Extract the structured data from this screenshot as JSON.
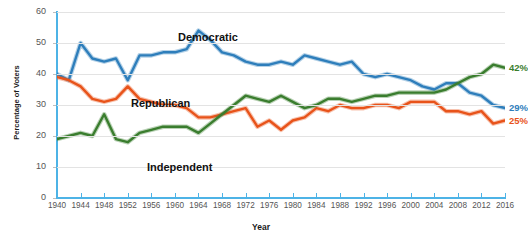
{
  "chart_data": {
    "type": "line",
    "title": "",
    "xlabel": "Year",
    "ylabel": "Percentage of Voters",
    "ylim": [
      0,
      60
    ],
    "xlim": [
      1940,
      2016
    ],
    "yticks": [
      0,
      10,
      20,
      30,
      40,
      50,
      60
    ],
    "xticks": [
      1940,
      1944,
      1948,
      1952,
      1956,
      1960,
      1964,
      1968,
      1972,
      1976,
      1980,
      1984,
      1988,
      1992,
      1996,
      2000,
      2004,
      2008,
      2012,
      2016
    ],
    "grid": true,
    "legend_position": "inline-on-plot",
    "colors": {
      "democratic": "#2e7ebb",
      "republican": "#e8531a",
      "independent": "#3a7d2e",
      "axis": "#4db3e6",
      "grid": "#e3e3e3",
      "tick_text": "#555555",
      "axis_title": "#1a1a1a"
    },
    "series": [
      {
        "name": "Democratic",
        "color": "#2e7ebb",
        "end_label": "29%",
        "label_x": 178,
        "label_y": 31,
        "x": [
          1940,
          1942,
          1944,
          1946,
          1948,
          1950,
          1952,
          1954,
          1956,
          1958,
          1960,
          1962,
          1964,
          1966,
          1968,
          1970,
          1972,
          1974,
          1976,
          1978,
          1980,
          1982,
          1984,
          1986,
          1988,
          1990,
          1992,
          1994,
          1996,
          1998,
          2000,
          2002,
          2004,
          2006,
          2008,
          2010,
          2012,
          2014,
          2016
        ],
        "y": [
          40,
          38,
          50,
          45,
          44,
          45,
          38,
          46,
          46,
          47,
          47,
          48,
          54,
          51,
          47,
          46,
          44,
          43,
          43,
          44,
          43,
          46,
          45,
          44,
          43,
          44,
          40,
          39,
          40,
          39,
          38,
          36,
          35,
          37,
          37,
          34,
          33,
          30,
          29
        ]
      },
      {
        "name": "Republican",
        "color": "#e8531a",
        "end_label": "25%",
        "label_x": 131,
        "label_y": 97,
        "x": [
          1940,
          1942,
          1944,
          1946,
          1948,
          1950,
          1952,
          1954,
          1956,
          1958,
          1960,
          1962,
          1964,
          1966,
          1968,
          1970,
          1972,
          1974,
          1976,
          1978,
          1980,
          1982,
          1984,
          1986,
          1988,
          1990,
          1992,
          1994,
          1996,
          1998,
          2000,
          2002,
          2004,
          2006,
          2008,
          2010,
          2012,
          2014,
          2016
        ],
        "y": [
          39,
          38,
          36,
          32,
          31,
          32,
          36,
          32,
          31,
          30,
          30,
          29,
          26,
          26,
          27,
          28,
          29,
          23,
          25,
          22,
          25,
          26,
          29,
          28,
          30,
          29,
          29,
          30,
          30,
          29,
          31,
          31,
          31,
          28,
          28,
          27,
          28,
          24,
          25
        ]
      },
      {
        "name": "Independent",
        "color": "#3a7d2e",
        "end_label": "42%",
        "label_x": 147,
        "label_y": 161,
        "x": [
          1940,
          1942,
          1944,
          1946,
          1948,
          1950,
          1952,
          1954,
          1956,
          1958,
          1960,
          1962,
          1964,
          1966,
          1968,
          1970,
          1972,
          1974,
          1976,
          1978,
          1980,
          1982,
          1984,
          1986,
          1988,
          1990,
          1992,
          1994,
          1996,
          1998,
          2000,
          2002,
          2004,
          2006,
          2008,
          2010,
          2012,
          2014,
          2016
        ],
        "y": [
          19,
          20,
          21,
          20,
          27,
          19,
          18,
          21,
          22,
          23,
          23,
          23,
          21,
          24,
          27,
          30,
          33,
          32,
          31,
          33,
          31,
          29,
          30,
          32,
          32,
          31,
          32,
          33,
          33,
          34,
          34,
          34,
          34,
          35,
          37,
          39,
          40,
          43,
          42
        ]
      }
    ]
  }
}
